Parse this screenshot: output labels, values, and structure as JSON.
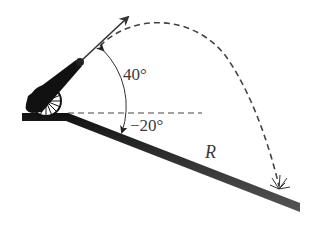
{
  "diagram": {
    "type": "projectile-on-incline",
    "labels": {
      "launch_angle": "40°",
      "incline_angle": "−20°",
      "range": "R"
    },
    "elements": [
      {
        "name": "cannon",
        "description": "cannon on wheel at top-left of incline"
      },
      {
        "name": "velocity-vector",
        "description": "arrow along barrel direction"
      },
      {
        "name": "trajectory",
        "description": "dashed parabolic path"
      },
      {
        "name": "horizontal-reference",
        "description": "dashed horizontal line"
      },
      {
        "name": "incline",
        "description": "ground sloping downward to the right"
      },
      {
        "name": "impact-mark",
        "description": "burst at landing point"
      }
    ],
    "colors": {
      "ink": "#1a1a1a",
      "dash": "#444444",
      "text": "#3a3a3a"
    }
  }
}
